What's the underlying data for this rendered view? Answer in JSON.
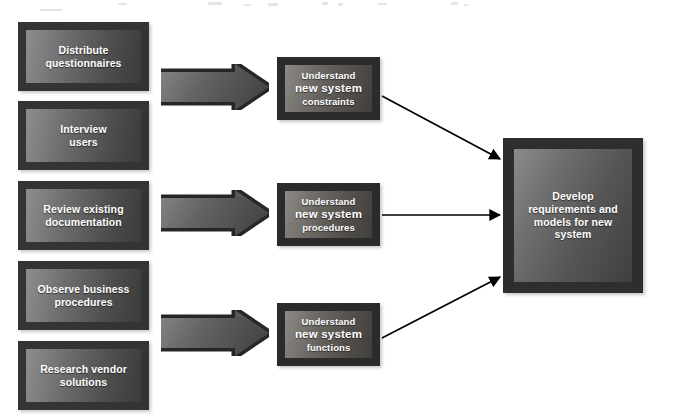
{
  "diagram": {
    "background_color": "#ffffff",
    "box_frame_color": "#2f2f2f",
    "arrow_color": "#000000",
    "text_color": "#ffffff"
  },
  "tasks": [
    {
      "id": "distribute-questionnaires",
      "line1": "Distribute",
      "line2": "questionnaires"
    },
    {
      "id": "interview-users",
      "line1": "Interview",
      "line2": "users"
    },
    {
      "id": "review-existing-documentation",
      "line1": "Review existing",
      "line2": "documentation"
    },
    {
      "id": "observe-business-procedures",
      "line1": "Observe business",
      "line2": "procedures"
    },
    {
      "id": "research-vendor-solutions",
      "line1": "Research vendor",
      "line2": "solutions"
    }
  ],
  "understand": [
    {
      "id": "understand-new-system-constraints",
      "line1": "Understand",
      "line2": "new system",
      "line3": "constraints"
    },
    {
      "id": "understand-new-system-procedures",
      "line1": "Understand",
      "line2": "new system",
      "line3": "procedures"
    },
    {
      "id": "understand-new-system-functions",
      "line1": "Understand",
      "line2": "new system",
      "line3": "functions"
    }
  ],
  "goal": {
    "id": "develop-requirements-and-models",
    "line1": "Develop",
    "line2": "requirements and",
    "line3": "models for new",
    "line4": "system"
  },
  "block_arrows": [
    {
      "id": "block-arrow-constraints",
      "label": ""
    },
    {
      "id": "block-arrow-procedures",
      "label": ""
    },
    {
      "id": "block-arrow-functions",
      "label": ""
    }
  ],
  "connectors": [
    {
      "id": "connector-constraints-to-goal",
      "from": "understand-new-system-constraints",
      "to": "develop-requirements-and-models"
    },
    {
      "id": "connector-procedures-to-goal",
      "from": "understand-new-system-procedures",
      "to": "develop-requirements-and-models"
    },
    {
      "id": "connector-functions-to-goal",
      "from": "understand-new-system-functions",
      "to": "develop-requirements-and-models"
    }
  ]
}
